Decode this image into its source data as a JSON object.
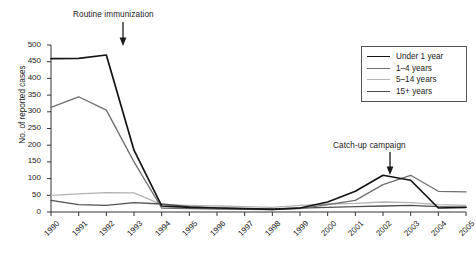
{
  "chart_data": {
    "type": "line",
    "title": "",
    "xlabel": "",
    "ylabel": "No. of reported cases",
    "x": [
      1990,
      1991,
      1992,
      1993,
      1994,
      1995,
      1996,
      1997,
      1998,
      1999,
      2000,
      2001,
      2002,
      2003,
      2004,
      2005
    ],
    "categories": [
      "1990",
      "1991",
      "1992",
      "1993",
      "1994",
      "1995",
      "1996",
      "1997",
      "1998",
      "1999",
      "2000",
      "2001",
      "2002",
      "2003",
      "2004",
      "2005"
    ],
    "xlim": [
      1990,
      2005
    ],
    "ylim": [
      0,
      500
    ],
    "yticks": [
      0,
      50,
      100,
      150,
      200,
      250,
      300,
      350,
      400,
      450,
      500
    ],
    "grid": false,
    "legend_position": "top-right",
    "series": [
      {
        "name": "Under 1 year",
        "color": "#141414",
        "values": [
          459,
          460,
          470,
          185,
          18,
          14,
          12,
          10,
          8,
          12,
          30,
          62,
          110,
          95,
          12,
          14
        ]
      },
      {
        "name": "1–4 years",
        "color": "#6e6e6e",
        "values": [
          313,
          345,
          305,
          150,
          12,
          10,
          9,
          8,
          7,
          10,
          22,
          35,
          82,
          110,
          62,
          60
        ]
      },
      {
        "name": "5–14 years",
        "color": "#b4b4b4",
        "values": [
          50,
          54,
          58,
          57,
          22,
          20,
          18,
          16,
          14,
          20,
          24,
          26,
          30,
          28,
          22,
          20
        ]
      },
      {
        "name": "15+ years",
        "color": "#505050",
        "values": [
          35,
          22,
          20,
          28,
          24,
          16,
          12,
          10,
          9,
          12,
          14,
          16,
          18,
          20,
          16,
          14
        ]
      }
    ],
    "annotations": [
      {
        "text": "Routine immunization",
        "x": 1993,
        "arrow": "down"
      },
      {
        "text": "Catch-up campaign",
        "x": 2003,
        "arrow": "down"
      }
    ]
  },
  "legend": {
    "items": [
      {
        "label": "Under 1 year",
        "color": "#141414"
      },
      {
        "label": "1–4 years",
        "color": "#6e6e6e"
      },
      {
        "label": "5–14 years",
        "color": "#b4b4b4"
      },
      {
        "label": "15+ years",
        "color": "#505050"
      }
    ]
  },
  "axes": {
    "y_title": "No. of reported cases",
    "y_ticks": [
      "500",
      "450",
      "400",
      "350",
      "300",
      "250",
      "200",
      "150",
      "100",
      "50",
      "0"
    ],
    "x_ticks": [
      "1990",
      "1991",
      "1992",
      "1993",
      "1994",
      "1995",
      "1996",
      "1997",
      "1998",
      "1999",
      "2000",
      "2001",
      "2002",
      "2003",
      "2004",
      "2005"
    ]
  },
  "annotations": {
    "routine": "Routine immunization",
    "catchup": "Catch-up campaign"
  }
}
